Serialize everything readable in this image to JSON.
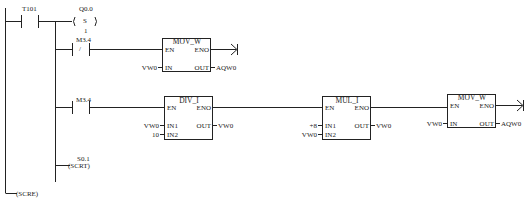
{
  "rung": {
    "contact_t101": "T101",
    "coil_q00_addr": "Q0.0",
    "coil_q00_type": "S",
    "coil_q00_count": "1",
    "contact_m34_nc_addr": "M3.4",
    "contact_m34_nc_sym": "/",
    "contact_m34_no_addr": "M3.4",
    "scrt_addr": "S0.1",
    "scrt_label": "(SCRT)",
    "scre_label": "(SCRE)"
  },
  "blocks": {
    "mov1": {
      "title": "MOV_W",
      "en": "EN",
      "eno": "ENO",
      "in_pin": "IN",
      "out_pin": "OUT",
      "in_val": "VW0",
      "out_val": "AQW0"
    },
    "div": {
      "title": "DIV_I",
      "en": "EN",
      "eno": "ENO",
      "in1_pin": "IN1",
      "in2_pin": "IN2",
      "out_pin": "OUT",
      "in1_val": "VW0",
      "in2_val": "10",
      "out_val": "VW0"
    },
    "mul": {
      "title": "MUL_I",
      "en": "EN",
      "eno": "ENO",
      "in1_pin": "IN1",
      "in2_pin": "IN2",
      "out_pin": "OUT",
      "in1_val": "+8",
      "in2_val": "VW0",
      "out_val": "VW0"
    },
    "mov2": {
      "title": "MOV_W",
      "en": "EN",
      "eno": "ENO",
      "in_pin": "IN",
      "out_pin": "OUT",
      "in_val": "VW0",
      "out_val": "AQW0"
    }
  },
  "colors": {
    "line": "#222222",
    "background": "#ffffff"
  }
}
